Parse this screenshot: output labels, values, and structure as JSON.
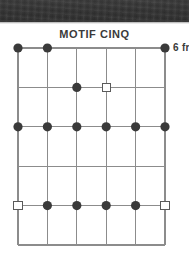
{
  "page": {
    "background_color": "#ffffff",
    "scan_band": {
      "present": true,
      "color": "#343434",
      "height_px": 22
    }
  },
  "header": {
    "title": "MOTIF CINQ"
  },
  "diagram": {
    "type": "guitar-fretboard-scale-diagram",
    "position_label": "6 fr",
    "string_count": 6,
    "fret_count": 5,
    "grid_color": "#8c8c8c",
    "marker_fill_color": "#3a3a3a",
    "marker_open_color": "#ffffff",
    "marker_open_stroke": "#5a5a5a",
    "strings": [
      "1",
      "2",
      "3",
      "4",
      "5",
      "6"
    ],
    "frets": [
      "1",
      "2",
      "3",
      "4",
      "5"
    ],
    "markers": [
      {
        "string": 1,
        "fret": 1,
        "type": "filled"
      },
      {
        "string": 2,
        "fret": 1,
        "type": "filled"
      },
      {
        "string": 6,
        "fret": 1,
        "type": "filled"
      },
      {
        "string": 3,
        "fret": 2,
        "type": "filled"
      },
      {
        "string": 4,
        "fret": 2,
        "type": "open-square"
      },
      {
        "string": 1,
        "fret": 3,
        "type": "filled"
      },
      {
        "string": 2,
        "fret": 3,
        "type": "filled"
      },
      {
        "string": 3,
        "fret": 3,
        "type": "filled"
      },
      {
        "string": 4,
        "fret": 3,
        "type": "filled"
      },
      {
        "string": 5,
        "fret": 3,
        "type": "filled"
      },
      {
        "string": 6,
        "fret": 3,
        "type": "filled"
      },
      {
        "string": 1,
        "fret": 5,
        "type": "open-square"
      },
      {
        "string": 2,
        "fret": 5,
        "type": "filled"
      },
      {
        "string": 3,
        "fret": 5,
        "type": "filled"
      },
      {
        "string": 4,
        "fret": 5,
        "type": "filled"
      },
      {
        "string": 5,
        "fret": 5,
        "type": "filled"
      },
      {
        "string": 6,
        "fret": 5,
        "type": "open-square"
      }
    ]
  }
}
